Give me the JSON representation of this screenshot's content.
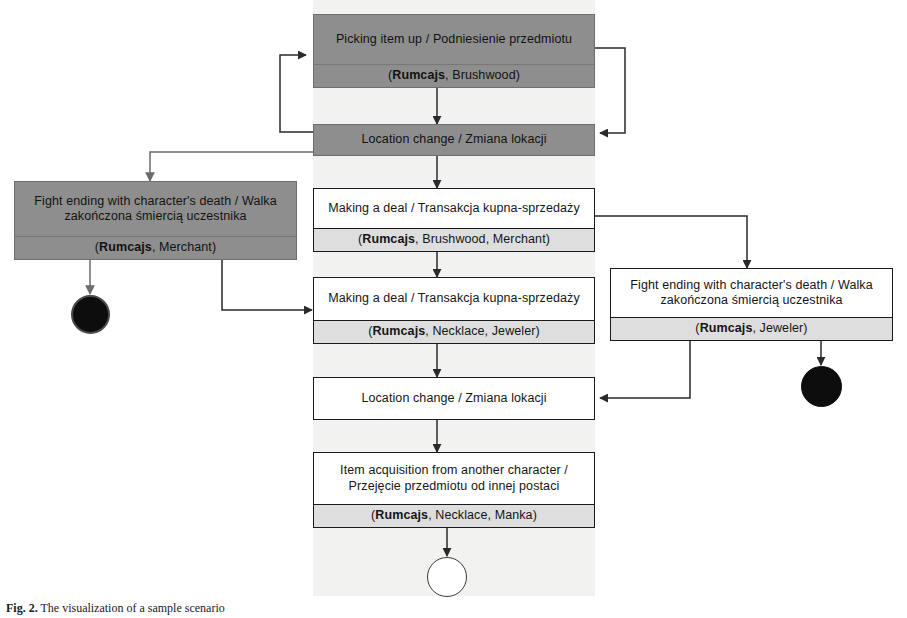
{
  "figure": {
    "caption_label": "Fig. 2.",
    "caption_text": "The visualization of a sample scenario"
  },
  "palette": {
    "shaded_fill": "#8e8e8e",
    "plain_fill": "#ffffff",
    "footer_fill": "#dedede",
    "line": "#1a1a1a",
    "band": "#f2f2f0",
    "terminal_filled": "#0d0d0d"
  },
  "nodes": [
    {
      "id": "picking-item-up",
      "title": "Picking item up / Podniesienie przedmiotu",
      "participants_prefix": "(",
      "participants_bold": "Rumcajs",
      "participants_rest": ", Brushwood)",
      "style": "shaded"
    },
    {
      "id": "location-change-top",
      "title": "Location change / Zmiana lokacji",
      "participants_prefix": "",
      "participants_bold": "",
      "participants_rest": "",
      "style": "shaded"
    },
    {
      "id": "fight-death-merchant",
      "title": "Fight ending with character's death / Walka zakończona śmiercią uczestnika",
      "participants_prefix": "(",
      "participants_bold": "Rumcajs",
      "participants_rest": ", Merchant)",
      "style": "shaded"
    },
    {
      "id": "making-deal-merchant",
      "title": "Making a deal / Transakcja kupna-sprzedaży",
      "participants_prefix": "(",
      "participants_bold": "Rumcajs",
      "participants_rest": ", Brushwood, Merchant)",
      "style": "plain"
    },
    {
      "id": "making-deal-jeweler",
      "title": "Making a deal / Transakcja kupna-sprzedaży",
      "participants_prefix": "(",
      "participants_bold": "Rumcajs",
      "participants_rest": ", Necklace, Jeweler)",
      "style": "plain"
    },
    {
      "id": "fight-death-jeweler",
      "title": "Fight ending with character's death / Walka zakończona śmiercią uczestnika",
      "participants_prefix": "(",
      "participants_bold": "Rumcajs",
      "participants_rest": ", Jeweler)",
      "style": "plain"
    },
    {
      "id": "location-change-bottom",
      "title": "Location change / Zmiana lokacji",
      "participants_prefix": "",
      "participants_bold": "",
      "participants_rest": "",
      "style": "plain"
    },
    {
      "id": "item-acquisition",
      "title": "Item acquisition from another character / Przejęcie przedmiotu od innej postaci",
      "participants_prefix": "(",
      "participants_bold": "Rumcajs",
      "participants_rest": ", Necklace, Manka)",
      "style": "plain"
    }
  ],
  "terminals": [
    {
      "id": "end-node-merchant",
      "kind": "ring"
    },
    {
      "id": "end-node-jeweler",
      "kind": "filled"
    },
    {
      "id": "end-node-final",
      "kind": "hollow"
    }
  ],
  "edges": [
    {
      "id": "edge-picking-to-location",
      "from": "picking-item-up",
      "to": "location-change-top"
    },
    {
      "id": "edge-location-loop-left",
      "from": "location-change-top",
      "to": "picking-item-up"
    },
    {
      "id": "edge-picking-loop-right",
      "from": "picking-item-up",
      "to": "location-change-top"
    },
    {
      "id": "edge-location-to-fight-merchant",
      "from": "location-change-top",
      "to": "fight-death-merchant"
    },
    {
      "id": "edge-location-to-deal-merchant",
      "from": "location-change-top",
      "to": "making-deal-merchant"
    },
    {
      "id": "edge-fight-merchant-to-end",
      "from": "fight-death-merchant",
      "to": "end-node-merchant"
    },
    {
      "id": "edge-fight-merchant-to-deal-jeweler",
      "from": "fight-death-merchant",
      "to": "making-deal-jeweler"
    },
    {
      "id": "edge-deal-merchant-to-deal-jeweler",
      "from": "making-deal-merchant",
      "to": "making-deal-jeweler"
    },
    {
      "id": "edge-deal-merchant-to-fight-jeweler",
      "from": "making-deal-merchant",
      "to": "fight-death-jeweler"
    },
    {
      "id": "edge-deal-jeweler-to-location-bottom",
      "from": "making-deal-jeweler",
      "to": "location-change-bottom"
    },
    {
      "id": "edge-fight-jeweler-to-location-bottom",
      "from": "fight-death-jeweler",
      "to": "location-change-bottom"
    },
    {
      "id": "edge-fight-jeweler-to-end",
      "from": "fight-death-jeweler",
      "to": "end-node-jeweler"
    },
    {
      "id": "edge-location-bottom-to-acquisition",
      "from": "location-change-bottom",
      "to": "item-acquisition"
    },
    {
      "id": "edge-acquisition-to-final",
      "from": "item-acquisition",
      "to": "end-node-final"
    }
  ]
}
